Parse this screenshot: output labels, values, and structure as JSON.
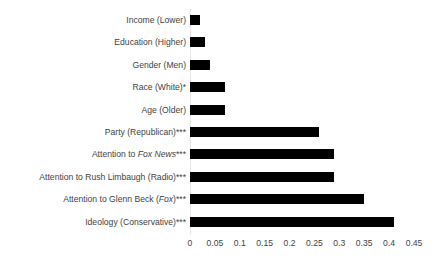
{
  "chart_data": {
    "type": "bar",
    "orientation": "horizontal",
    "title": "",
    "subtitle": "",
    "xlabel": "",
    "ylabel": "",
    "xlim": [
      0,
      0.45
    ],
    "grid": false,
    "legend": null,
    "bar_color": "#000000",
    "axis_line_color": "#e8e8e8",
    "text_color": "#3f3f3f",
    "xticks": [
      "0",
      "0.05",
      "0.1",
      "0.15",
      "0.2",
      "0.25",
      "0.3",
      "0.35",
      "0.4",
      "0.45"
    ],
    "xtick_values": [
      0,
      0.05,
      0.1,
      0.15,
      0.2,
      0.25,
      0.3,
      0.35,
      0.4,
      0.45
    ],
    "categories": [
      "Income (Lower)",
      "Education (Higher)",
      "Gender (Men)",
      "Race (White)*",
      "Age (Older)",
      "Party (Republican)***",
      "Attention to Fox News***",
      "Attention to Rush Limbaugh (Radio)***",
      "Attention to Glenn Beck (Fox)***",
      "Ideology (Conservative)***"
    ],
    "values": [
      0.02,
      0.03,
      0.04,
      0.07,
      0.07,
      0.26,
      0.29,
      0.29,
      0.35,
      0.41
    ],
    "bars": [
      {
        "label": "Income (Lower)",
        "value": 0.02,
        "significance": ""
      },
      {
        "label": "Education (Higher)",
        "value": 0.03,
        "significance": ""
      },
      {
        "label": "Gender (Men)",
        "value": 0.04,
        "significance": ""
      },
      {
        "label": "Race (White)*",
        "value": 0.07,
        "significance": "*"
      },
      {
        "label": "Age (Older)",
        "value": 0.07,
        "significance": ""
      },
      {
        "label": "Party (Republican)***",
        "value": 0.26,
        "significance": "***"
      },
      {
        "label": "Attention to Fox News***",
        "value": 0.29,
        "significance": "***"
      },
      {
        "label": "Attention to Rush Limbaugh (Radio)***",
        "value": 0.29,
        "significance": "***"
      },
      {
        "label": "Attention to Glenn Beck (Fox)***",
        "value": 0.35,
        "significance": "***"
      },
      {
        "label": "Ideology (Conservative)***",
        "value": 0.41,
        "significance": "***"
      }
    ],
    "label_parts": [
      {
        "pre": "Income (Lower)",
        "italic": "",
        "post": ""
      },
      {
        "pre": "Education (Higher)",
        "italic": "",
        "post": ""
      },
      {
        "pre": "Gender (Men)",
        "italic": "",
        "post": ""
      },
      {
        "pre": "Race (White)*",
        "italic": "",
        "post": ""
      },
      {
        "pre": "Age (Older)",
        "italic": "",
        "post": ""
      },
      {
        "pre": "Party (Republican)***",
        "italic": "",
        "post": ""
      },
      {
        "pre": "Attention to ",
        "italic": "Fox News",
        "post": "***"
      },
      {
        "pre": "Attention to Rush Limbaugh (Radio)***",
        "italic": "",
        "post": ""
      },
      {
        "pre": "Attention to Glenn Beck (",
        "italic": "Fox",
        "post": ")***"
      },
      {
        "pre": "Ideology (Conservative)***",
        "italic": "",
        "post": ""
      }
    ]
  }
}
